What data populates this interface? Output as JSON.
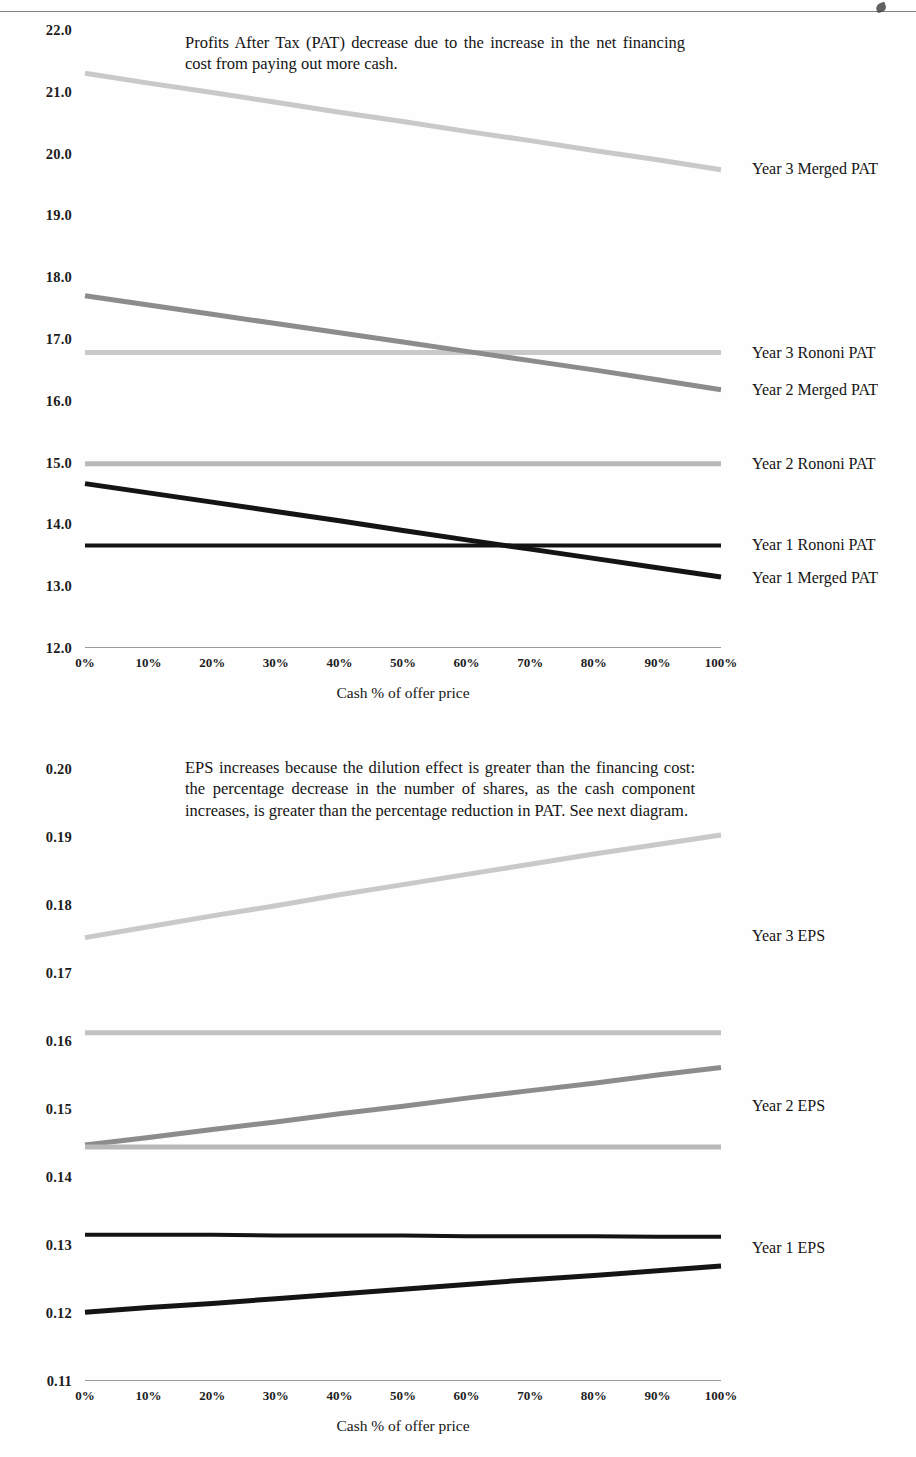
{
  "page": {
    "background": "#ffffff",
    "scan_artifact": true
  },
  "chart_data": [
    {
      "id": "pat-chart",
      "type": "line",
      "title": "",
      "annotation": "Profits After Tax (PAT) decrease due to the increase in the net financing cost from paying out more cash.",
      "xlabel": "Cash % of offer price",
      "ylabel": "",
      "x": [
        0,
        10,
        20,
        30,
        40,
        50,
        60,
        70,
        80,
        90,
        100
      ],
      "xticklabels": [
        "0%",
        "10%",
        "20%",
        "30%",
        "40%",
        "50%",
        "60%",
        "70%",
        "80%",
        "90%",
        "100%"
      ],
      "xlim": [
        0,
        100
      ],
      "ylim": [
        12.0,
        22.0
      ],
      "yticks": [
        12.0,
        13.0,
        14.0,
        15.0,
        16.0,
        17.0,
        18.0,
        19.0,
        20.0,
        21.0,
        22.0
      ],
      "yticklabels": [
        "12.0",
        "13.0",
        "14.0",
        "15.0",
        "16.0",
        "17.0",
        "18.0",
        "19.0",
        "20.0",
        "21.0",
        "22.0"
      ],
      "grid": false,
      "legend": "right-inline",
      "series": [
        {
          "name": "Year 3 Merged PAT",
          "color": "#c9c9c9",
          "width": 5,
          "label_y": 19.75,
          "values": [
            21.3,
            21.14,
            20.99,
            20.83,
            20.67,
            20.52,
            20.36,
            20.21,
            20.05,
            19.9,
            19.74
          ]
        },
        {
          "name": "Year 3 Rononi PAT",
          "color": "#c9c9c9",
          "width": 5,
          "label_y": 16.78,
          "values": [
            16.78,
            16.78,
            16.78,
            16.78,
            16.78,
            16.78,
            16.78,
            16.78,
            16.78,
            16.78,
            16.78
          ]
        },
        {
          "name": "Year 2 Merged PAT",
          "color": "#8c8c8c",
          "width": 5,
          "label_y": 16.18,
          "values": [
            17.7,
            17.55,
            17.4,
            17.25,
            17.1,
            16.95,
            16.8,
            16.65,
            16.5,
            16.34,
            16.18
          ]
        },
        {
          "name": "Year 2 Rononi PAT",
          "color": "#b9b9b9",
          "width": 5,
          "label_y": 14.98,
          "values": [
            14.98,
            14.98,
            14.98,
            14.98,
            14.98,
            14.98,
            14.98,
            14.98,
            14.98,
            14.98,
            14.98
          ]
        },
        {
          "name": "Year 1 Rononi PAT",
          "color": "#141414",
          "width": 4,
          "label_y": 13.66,
          "values": [
            13.66,
            13.66,
            13.66,
            13.66,
            13.66,
            13.66,
            13.66,
            13.66,
            13.66,
            13.66,
            13.66
          ]
        },
        {
          "name": "Year 1 Merged PAT",
          "color": "#141414",
          "width": 5,
          "label_y": 13.14,
          "values": [
            14.66,
            14.51,
            14.36,
            14.21,
            14.06,
            13.9,
            13.75,
            13.6,
            13.45,
            13.3,
            13.15
          ]
        }
      ]
    },
    {
      "id": "eps-chart",
      "type": "line",
      "title": "",
      "annotation": "EPS increases because the dilution effect is greater than the financing cost:  the percentage decrease in the number of shares, as the cash component increases, is greater than the percentage reduction in PAT. See next diagram.",
      "xlabel": "Cash % of offer price",
      "ylabel": "",
      "x": [
        0,
        10,
        20,
        30,
        40,
        50,
        60,
        70,
        80,
        90,
        100
      ],
      "xticklabels": [
        "0%",
        "10%",
        "20%",
        "30%",
        "40%",
        "50%",
        "60%",
        "70%",
        "80%",
        "90%",
        "100%"
      ],
      "xlim": [
        0,
        100
      ],
      "ylim": [
        0.11,
        0.2
      ],
      "yticks": [
        0.11,
        0.12,
        0.13,
        0.14,
        0.15,
        0.16,
        0.17,
        0.18,
        0.19,
        0.2
      ],
      "yticklabels": [
        "0.11",
        "0.12",
        "0.13",
        "0.14",
        "0.15",
        "0.16",
        "0.17",
        "0.18",
        "0.19",
        "0.20"
      ],
      "grid": false,
      "legend": "right-inline",
      "series": [
        {
          "name": "Year 3 EPS",
          "color": "#c9c9c9",
          "width": 5,
          "label_y": 0.1755,
          "values": [
            0.1752,
            0.1768,
            0.1784,
            0.1799,
            0.1815,
            0.183,
            0.1845,
            0.186,
            0.1875,
            0.1889,
            0.1903
          ]
        },
        {
          "name": "Year 3 Rononi EPS",
          "color": "#c2c2c2",
          "width": 5,
          "label_y": null,
          "values": [
            0.1612,
            0.1612,
            0.1612,
            0.1612,
            0.1612,
            0.1612,
            0.1612,
            0.1612,
            0.1612,
            0.1612,
            0.1612
          ]
        },
        {
          "name": "Year 2 EPS",
          "color": "#8c8c8c",
          "width": 5,
          "label_y": 0.1505,
          "values": [
            0.1447,
            0.1458,
            0.147,
            0.1481,
            0.1493,
            0.1504,
            0.1516,
            0.1527,
            0.1538,
            0.155,
            0.1561
          ]
        },
        {
          "name": "Year 2 Rononi EPS",
          "color": "#b9b9b9",
          "width": 5,
          "label_y": null,
          "values": [
            0.1444,
            0.1444,
            0.1444,
            0.1444,
            0.1444,
            0.1444,
            0.1444,
            0.1444,
            0.1444,
            0.1444,
            0.1444
          ]
        },
        {
          "name": "Year 1 EPS",
          "color": "#141414",
          "width": 4,
          "label_y": 0.1295,
          "values": [
            0.1315,
            0.1315,
            0.1315,
            0.1314,
            0.1314,
            0.1314,
            0.1313,
            0.1313,
            0.1313,
            0.1312,
            0.1312
          ]
        },
        {
          "name": "Year 1 Merged EPS",
          "color": "#141414",
          "width": 5,
          "label_y": null,
          "values": [
            0.1201,
            0.1208,
            0.1214,
            0.1221,
            0.1228,
            0.1235,
            0.1242,
            0.1249,
            0.1255,
            0.1262,
            0.1269
          ]
        }
      ]
    }
  ]
}
